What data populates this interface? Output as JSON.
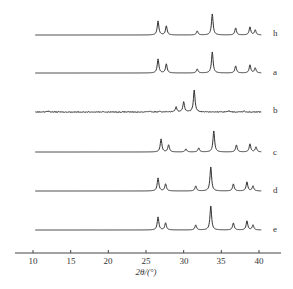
{
  "chart_data": {
    "type": "line",
    "title": "",
    "xlabel": "2θ/(°)",
    "ylabel": "",
    "xlim": [
      10,
      40
    ],
    "xticks": [
      10,
      15,
      20,
      25,
      30,
      35,
      40
    ],
    "grid": false,
    "legend": "inline labels at right end of each trace",
    "series": [
      {
        "name": "h",
        "baseline_y": 35,
        "peaks": [
          [
            26.6,
            14
          ],
          [
            27.7,
            9
          ],
          [
            31.8,
            4
          ],
          [
            33.8,
            21
          ],
          [
            36.9,
            7
          ],
          [
            38.8,
            8
          ],
          [
            39.5,
            5
          ]
        ]
      },
      {
        "name": "a",
        "baseline_y": 73,
        "peaks": [
          [
            26.6,
            14
          ],
          [
            27.7,
            9
          ],
          [
            31.8,
            4
          ],
          [
            33.8,
            21
          ],
          [
            36.9,
            7
          ],
          [
            38.8,
            8
          ],
          [
            39.5,
            5
          ]
        ]
      },
      {
        "name": "b",
        "baseline_y": 112,
        "noisy": true,
        "peaks": [
          [
            29.0,
            5
          ],
          [
            30.0,
            10
          ],
          [
            31.4,
            22
          ],
          [
            12.0,
            1
          ],
          [
            25.5,
            1
          ],
          [
            26.8,
            1
          ],
          [
            36.0,
            1
          ],
          [
            38.0,
            1
          ]
        ]
      },
      {
        "name": "c",
        "baseline_y": 152,
        "peaks": [
          [
            27.0,
            13
          ],
          [
            28.0,
            7
          ],
          [
            30.3,
            3
          ],
          [
            32.0,
            4
          ],
          [
            34.0,
            21
          ],
          [
            37.0,
            7
          ],
          [
            38.8,
            8
          ],
          [
            39.6,
            5
          ]
        ]
      },
      {
        "name": "d",
        "baseline_y": 191,
        "peaks": [
          [
            26.6,
            13
          ],
          [
            27.6,
            7
          ],
          [
            31.6,
            5
          ],
          [
            33.6,
            24
          ],
          [
            36.6,
            7
          ],
          [
            38.4,
            9
          ],
          [
            39.2,
            5
          ]
        ]
      },
      {
        "name": "e",
        "baseline_y": 230,
        "peaks": [
          [
            26.6,
            13
          ],
          [
            27.6,
            7
          ],
          [
            31.6,
            5
          ],
          [
            33.6,
            24
          ],
          [
            36.6,
            7
          ],
          [
            38.4,
            9
          ],
          [
            39.2,
            5
          ]
        ]
      }
    ]
  },
  "labels": {
    "h": "h",
    "a": "a",
    "b": "b",
    "c": "c",
    "d": "d",
    "e": "e"
  },
  "axis": {
    "xlabel": "2θ/(°)",
    "ticks": [
      "10",
      "15",
      "20",
      "25",
      "30",
      "35",
      "40"
    ]
  }
}
